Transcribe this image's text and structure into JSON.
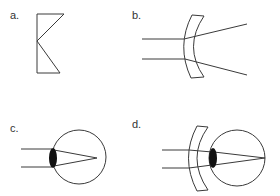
{
  "figure": {
    "panels": [
      {
        "id": "a",
        "label": "a.",
        "description": "Concave lens cross-section (schematic)"
      },
      {
        "id": "b",
        "label": "b.",
        "description": "Concave lens diverging parallel rays"
      },
      {
        "id": "c",
        "label": "c.",
        "description": "Eye with rays converging in front of the retina (myopia)"
      },
      {
        "id": "d",
        "label": "d.",
        "description": "Eye corrected with a concave lens; rays focus on the retina"
      }
    ],
    "colors": {
      "line": "#3a3a3a",
      "lens_fill": "#111111",
      "background": "#ffffff"
    }
  }
}
